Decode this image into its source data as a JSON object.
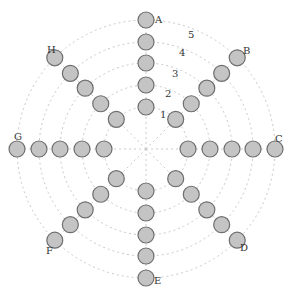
{
  "diagram": {
    "center": [
      146,
      149
    ],
    "ring_radii": [
      42,
      64,
      86,
      107,
      129
    ],
    "node_radius": 8,
    "colors": {
      "node_fill": "#c4c4c4",
      "node_stroke": "#6e6e6e",
      "ring": "#c8c8c8",
      "text": "#333333"
    },
    "ring_labels": [
      {
        "text": "1",
        "x": 160,
        "y": 118
      },
      {
        "text": "2",
        "x": 165,
        "y": 97
      },
      {
        "text": "3",
        "x": 172,
        "y": 77
      },
      {
        "text": "4",
        "x": 179,
        "y": 56
      },
      {
        "text": "5",
        "x": 188,
        "y": 38
      }
    ],
    "spokes": [
      {
        "label": "A",
        "angle": -90,
        "label_x": 155,
        "label_y": 23
      },
      {
        "label": "B",
        "angle": -45,
        "label_x": 243,
        "label_y": 54
      },
      {
        "label": "C",
        "angle": 0,
        "label_x": 275,
        "label_y": 142
      },
      {
        "label": "D",
        "angle": 45,
        "label_x": 240,
        "label_y": 251
      },
      {
        "label": "E",
        "angle": 90,
        "label_x": 154,
        "label_y": 284
      },
      {
        "label": "F",
        "angle": 135,
        "label_x": 46,
        "label_y": 254
      },
      {
        "label": "G",
        "angle": 180,
        "label_x": 14,
        "label_y": 140
      },
      {
        "label": "H",
        "angle": -135,
        "label_x": 47,
        "label_y": 53
      }
    ]
  }
}
